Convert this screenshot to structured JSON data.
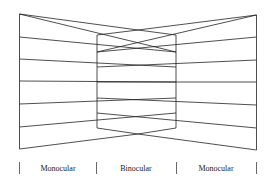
{
  "diagram": {
    "labels": {
      "left": "Monocular",
      "center": "Binocular",
      "right": "Monocular"
    },
    "stroke_color": "#222222",
    "background": "#ffffff"
  }
}
